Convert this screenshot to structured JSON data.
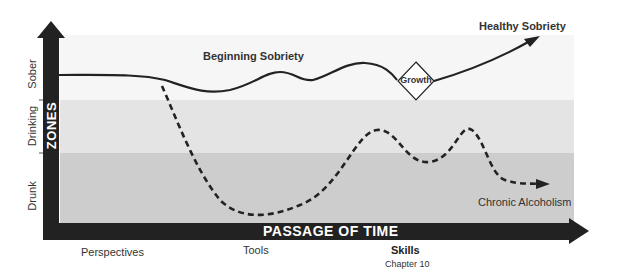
{
  "diagram": {
    "y_axis": {
      "zones_label": "ZONES",
      "zone_labels": [
        "Sober",
        "Drinking",
        "Drunk"
      ]
    },
    "x_axis": {
      "label": "PASSAGE OF TIME",
      "stages": [
        {
          "label": "Perspectives",
          "sub": ""
        },
        {
          "label": "Tools",
          "sub": ""
        },
        {
          "label": "Skills",
          "sub": "Chapter 10"
        }
      ]
    },
    "curves": {
      "beginning_sobriety": "Beginning Sobriety",
      "healthy_sobriety": "Healthy Sobriety",
      "chronic_alcoholism": "Chronic Alcoholism",
      "growth_node": "Growth"
    },
    "colors": {
      "axis": "#222222",
      "sober_band": "#f6f6f6",
      "drinking_band": "#e4e4e4",
      "drunk_band": "#cdcdcd"
    }
  }
}
